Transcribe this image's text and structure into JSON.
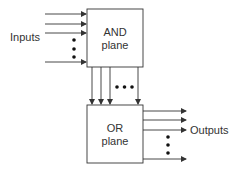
{
  "diagram": {
    "and_plane": {
      "line1": "AND",
      "line2": "plane"
    },
    "or_plane": {
      "line1": "OR",
      "line2": "plane"
    },
    "inputs_label": "Inputs",
    "outputs_label": "Outputs",
    "colors": {
      "stroke": "#333333",
      "background": "#ffffff"
    }
  }
}
